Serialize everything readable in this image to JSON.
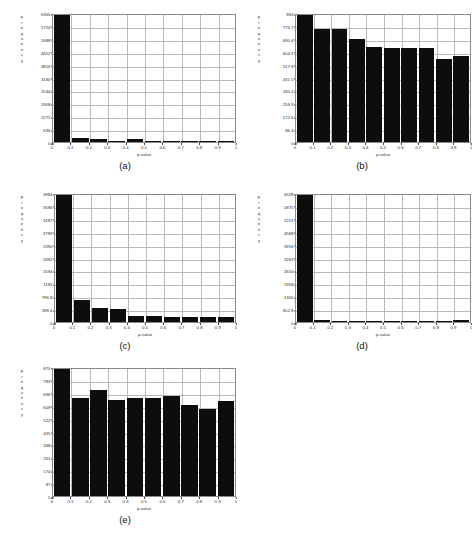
{
  "figure": {
    "caption_a": "(a)",
    "caption_b": "(b)",
    "caption_c": "(c)",
    "caption_d": "(d)",
    "caption_e": "(e)",
    "ylabel_letters": [
      "F",
      "r",
      "e",
      "q",
      "u",
      "e",
      "n",
      "c",
      "y"
    ],
    "xlabel": "p-value",
    "bar_color": "#0d0d0d",
    "grid_color": "#b9b9b9",
    "axis_color": "#8a8a8a"
  },
  "chart_data": [
    {
      "type": "bar",
      "panel": "(a)",
      "title": "",
      "xlabel": "p-value",
      "ylabel": "Frequency",
      "categories": [
        "0-0.1",
        "0.1-0.2",
        "0.2-0.3",
        "0.3-0.4",
        "0.4-0.5",
        "0.5-0.6",
        "0.6-0.7",
        "0.7-0.8",
        "0.8-0.9",
        "0.9-1"
      ],
      "xticklabels": [
        "0",
        "0.1",
        "0.2",
        "0.3",
        "0.4",
        "0.5",
        "0.6",
        "0.7",
        "0.8",
        "0.9",
        "1"
      ],
      "yticklabels": [
        "0",
        "636",
        "1272",
        "1908",
        "2544",
        "3180",
        "3816",
        "4452",
        "5088",
        "5724",
        "6360"
      ],
      "values": [
        6360,
        185,
        150,
        60,
        130,
        30,
        12,
        8,
        6,
        10
      ],
      "xlim": [
        0,
        1
      ],
      "ylim": [
        0,
        6360
      ],
      "grid": true,
      "legend": "none"
    },
    {
      "type": "bar",
      "panel": "(b)",
      "title": "",
      "xlabel": "p-value",
      "ylabel": "Frequency",
      "categories": [
        "0-0.1",
        "0.1-0.2",
        "0.2-0.3",
        "0.3-0.4",
        "0.4-0.5",
        "0.5-0.6",
        "0.6-0.7",
        "0.7-0.8",
        "0.8-0.9",
        "0.9-1"
      ],
      "xticklabels": [
        "0",
        "0.1",
        "0.2",
        "0.3",
        "0.4",
        "0.5",
        "0.6",
        "0.7",
        "0.8",
        "0.9",
        "1"
      ],
      "yticklabels": [
        "0",
        "86.3",
        "172.6",
        "258.9",
        "345.2",
        "431.5",
        "517.8",
        "604.1",
        "690.4",
        "776.7",
        "863"
      ],
      "values": [
        863,
        755,
        758,
        690,
        637,
        628,
        626,
        629,
        555,
        575
      ],
      "xlim": [
        0,
        1
      ],
      "ylim": [
        0,
        863
      ],
      "grid": true,
      "legend": "none"
    },
    {
      "type": "bar",
      "panel": "(c)",
      "title": "",
      "xlabel": "p-value",
      "ylabel": "Frequency",
      "categories": [
        "0-0.1",
        "0.1-0.2",
        "0.2-0.3",
        "0.3-0.4",
        "0.4-0.5",
        "0.5-0.6",
        "0.6-0.7",
        "0.7-0.8",
        "0.8-0.9",
        "0.9-1"
      ],
      "xticklabels": [
        "0",
        "0.1",
        "0.2",
        "0.3",
        "0.4",
        "0.5",
        "0.6",
        "0.7",
        "0.8",
        "0.9",
        "1"
      ],
      "yticklabels": [
        "0",
        "398.4",
        "796.8",
        "1195",
        "1594",
        "1992",
        "2390",
        "2789",
        "3187",
        "3586",
        "3984"
      ],
      "values": [
        3984,
        690,
        440,
        400,
        200,
        195,
        165,
        160,
        155,
        150
      ],
      "xlim": [
        0,
        1
      ],
      "ylim": [
        0,
        3984
      ],
      "grid": true,
      "legend": "none"
    },
    {
      "type": "bar",
      "panel": "(d)",
      "title": "",
      "xlabel": "p-value",
      "ylabel": "Frequency",
      "categories": [
        "0-0.1",
        "0.1-0.2",
        "0.2-0.3",
        "0.3-0.4",
        "0.4-0.5",
        "0.5-0.6",
        "0.6-0.7",
        "0.7-0.8",
        "0.8-0.9",
        "0.9-1"
      ],
      "xticklabels": [
        "0",
        "0.1",
        "0.2",
        "0.3",
        "0.4",
        "0.5",
        "0.6",
        "0.7",
        "0.8",
        "0.9",
        "1"
      ],
      "yticklabels": [
        "0",
        "652.8",
        "1305",
        "1958",
        "2610",
        "3263",
        "3916",
        "4568",
        "5221",
        "5875",
        "6528"
      ],
      "values": [
        6528,
        95,
        70,
        30,
        22,
        18,
        25,
        20,
        18,
        90
      ],
      "xlim": [
        0,
        1
      ],
      "ylim": [
        0,
        6528
      ],
      "grid": true,
      "legend": "none"
    },
    {
      "type": "bar",
      "panel": "(e)",
      "title": "",
      "xlabel": "p-value",
      "ylabel": "Frequency",
      "categories": [
        "0-0.1",
        "0.1-0.2",
        "0.2-0.3",
        "0.3-0.4",
        "0.4-0.5",
        "0.5-0.6",
        "0.6-0.7",
        "0.7-0.8",
        "0.8-0.9",
        "0.9-1"
      ],
      "xticklabels": [
        "0",
        "0.1",
        "0.2",
        "0.3",
        "0.4",
        "0.5",
        "0.6",
        "0.7",
        "0.8",
        "0.9",
        "1"
      ],
      "yticklabels": [
        "0",
        "87",
        "174",
        "261",
        "348",
        "435",
        "522",
        "609",
        "696",
        "783",
        "870"
      ],
      "values": [
        870,
        663,
        713,
        650,
        663,
        663,
        672,
        615,
        585,
        640
      ],
      "xlim": [
        0,
        1
      ],
      "ylim": [
        0,
        870
      ],
      "grid": true,
      "legend": "none"
    }
  ]
}
